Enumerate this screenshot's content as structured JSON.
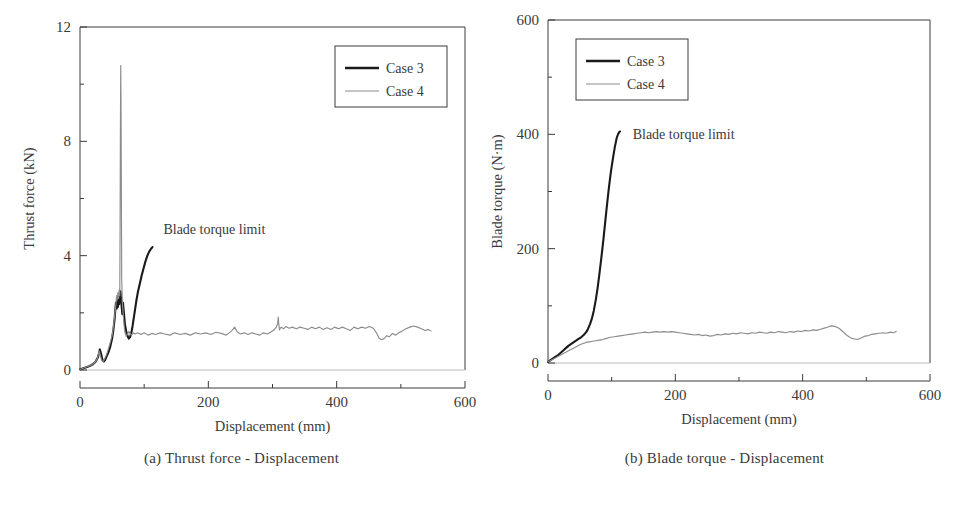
{
  "figure": {
    "background": "#ffffff",
    "ink": "#3a3a3a",
    "panels": [
      {
        "id": "a",
        "caption": "(a) Thrust force - Displacement",
        "annotation": "Blade torque limit"
      },
      {
        "id": "b",
        "caption": "(b) Blade torque - Displacement",
        "annotation": "Blade torque limit"
      }
    ]
  },
  "legend": {
    "entries": [
      {
        "label": "Case 3",
        "color": "#1a1a1a",
        "width": 2.6
      },
      {
        "label": "Case 4",
        "color": "#8c8c8c",
        "width": 1.2
      }
    ]
  },
  "chart_data": [
    {
      "type": "line",
      "title": "(a) Thrust force - Displacement",
      "xlabel": "Displacement (mm)",
      "ylabel": "Thrust force (kN)",
      "xlim": [
        0,
        600
      ],
      "ylim": [
        0,
        12
      ],
      "xticks": [
        0,
        200,
        400,
        600
      ],
      "xticklabels": [
        "0",
        "200",
        "400",
        "600"
      ],
      "xminorticks": [
        100,
        300,
        500
      ],
      "yticks": [
        0,
        4,
        8,
        12
      ],
      "yticklabels": [
        "0",
        "4",
        "8",
        "12"
      ],
      "yminorticks": [
        2,
        6,
        10
      ],
      "grid": false,
      "legend_position": "upper-right",
      "annotations": [
        {
          "text": "Blade torque limit",
          "x": 130,
          "y": 4.75
        }
      ],
      "series": [
        {
          "name": "Case 3",
          "color": "#1a1a1a",
          "x": [
            0,
            5,
            10,
            15,
            20,
            24,
            28,
            31,
            33,
            35,
            37,
            39,
            41,
            44,
            47,
            50,
            52,
            54,
            55,
            56,
            57,
            58,
            59,
            60,
            61,
            62,
            63,
            64,
            65,
            66,
            67,
            68,
            69,
            70,
            72,
            74,
            76,
            78,
            80,
            82,
            84,
            86,
            88,
            90,
            93,
            96,
            99,
            102,
            105,
            108,
            111,
            113
          ],
          "y": [
            0.02,
            0.06,
            0.1,
            0.14,
            0.2,
            0.28,
            0.45,
            0.72,
            0.55,
            0.35,
            0.3,
            0.35,
            0.45,
            0.6,
            0.8,
            1.1,
            1.4,
            1.8,
            2.1,
            2.35,
            2.15,
            2.45,
            2.2,
            2.55,
            2.3,
            2.6,
            2.75,
            2.5,
            2.2,
            1.95,
            2.35,
            2.1,
            1.85,
            1.6,
            1.35,
            1.2,
            1.1,
            1.15,
            1.3,
            1.55,
            1.85,
            2.15,
            2.45,
            2.7,
            3.0,
            3.3,
            3.55,
            3.8,
            4.0,
            4.15,
            4.25,
            4.3
          ]
        },
        {
          "name": "Case 4",
          "color": "#8c8c8c",
          "x": [
            0,
            6,
            12,
            18,
            23,
            27,
            30,
            32,
            34,
            36,
            38,
            41,
            44,
            47,
            50,
            52,
            54,
            56,
            57,
            58,
            59,
            60,
            61,
            62,
            62.5,
            63,
            63.5,
            64,
            64.5,
            65,
            66,
            67,
            68,
            69,
            70,
            72,
            74,
            76,
            78,
            80,
            83,
            86,
            90,
            95,
            100,
            106,
            112,
            118,
            125,
            132,
            140,
            148,
            156,
            164,
            172,
            180,
            188,
            196,
            204,
            212,
            220,
            228,
            236,
            241,
            245,
            250,
            256,
            262,
            268,
            274,
            280,
            286,
            292,
            298,
            303,
            306,
            308,
            309,
            310,
            311,
            312,
            314,
            317,
            321,
            326,
            331,
            337,
            343,
            349,
            355,
            361,
            367,
            373,
            379,
            385,
            391,
            397,
            403,
            409,
            415,
            421,
            427,
            433,
            439,
            445,
            451,
            457,
            462,
            466,
            470,
            474,
            478,
            482,
            487,
            492,
            497,
            502,
            508,
            514,
            520,
            526,
            532,
            538,
            543,
            547
          ],
          "y": [
            0.02,
            0.07,
            0.12,
            0.18,
            0.26,
            0.4,
            0.66,
            0.48,
            0.32,
            0.3,
            0.38,
            0.52,
            0.72,
            0.95,
            1.2,
            1.5,
            1.9,
            2.3,
            2.6,
            2.45,
            2.7,
            2.5,
            2.8,
            2.6,
            5.2,
            8.5,
            10.65,
            9.0,
            6.0,
            3.2,
            2.4,
            2.05,
            1.75,
            1.5,
            1.32,
            1.18,
            1.25,
            1.35,
            1.28,
            1.22,
            1.3,
            1.26,
            1.3,
            1.24,
            1.3,
            1.22,
            1.28,
            1.24,
            1.3,
            1.26,
            1.22,
            1.3,
            1.24,
            1.28,
            1.22,
            1.3,
            1.26,
            1.3,
            1.24,
            1.32,
            1.28,
            1.22,
            1.36,
            1.5,
            1.34,
            1.26,
            1.3,
            1.24,
            1.3,
            1.26,
            1.22,
            1.3,
            1.26,
            1.34,
            1.42,
            1.5,
            1.62,
            1.85,
            1.55,
            1.4,
            1.46,
            1.5,
            1.44,
            1.52,
            1.46,
            1.5,
            1.44,
            1.5,
            1.46,
            1.42,
            1.5,
            1.44,
            1.5,
            1.42,
            1.48,
            1.42,
            1.5,
            1.44,
            1.5,
            1.44,
            1.38,
            1.5,
            1.44,
            1.5,
            1.46,
            1.52,
            1.46,
            1.3,
            1.12,
            1.06,
            1.1,
            1.2,
            1.16,
            1.28,
            1.22,
            1.3,
            1.36,
            1.44,
            1.5,
            1.54,
            1.5,
            1.44,
            1.38,
            1.42,
            1.36
          ]
        }
      ]
    },
    {
      "type": "line",
      "title": "(b) Blade torque - Displacement",
      "xlabel": "Displacement (mm)",
      "ylabel": "Blade torque (N·m)",
      "xlim": [
        0,
        600
      ],
      "ylim": [
        0,
        600
      ],
      "xticks": [
        0,
        200,
        400,
        600
      ],
      "xticklabels": [
        "0",
        "200",
        "400",
        "600"
      ],
      "xminorticks": [
        100,
        300,
        500
      ],
      "yticks": [
        0,
        200,
        400,
        600
      ],
      "yticklabels": [
        "0",
        "200",
        "400",
        "600"
      ],
      "yminorticks": [
        100,
        300,
        500
      ],
      "grid": false,
      "legend_position": "upper-left",
      "annotations": [
        {
          "text": "Blade torque limit",
          "x": 133,
          "y": 392
        }
      ],
      "series": [
        {
          "name": "Case 3",
          "color": "#1a1a1a",
          "x": [
            0,
            4,
            8,
            12,
            16,
            20,
            24,
            28,
            32,
            36,
            40,
            44,
            48,
            52,
            56,
            60,
            63,
            66,
            69,
            72,
            75,
            78,
            81,
            84,
            87,
            90,
            93,
            96,
            99,
            102,
            105,
            108,
            110,
            112,
            113
          ],
          "y": [
            2,
            5,
            8,
            11,
            14,
            18,
            22,
            26,
            30,
            33,
            36,
            39,
            42,
            45,
            49,
            54,
            60,
            68,
            78,
            92,
            110,
            132,
            158,
            186,
            216,
            248,
            280,
            310,
            336,
            358,
            378,
            394,
            400,
            404,
            405
          ]
        },
        {
          "name": "Case 4",
          "color": "#8c8c8c",
          "x": [
            0,
            5,
            10,
            15,
            20,
            25,
            30,
            35,
            40,
            45,
            50,
            55,
            60,
            65,
            70,
            75,
            80,
            86,
            92,
            98,
            104,
            110,
            116,
            122,
            128,
            134,
            140,
            146,
            152,
            158,
            164,
            170,
            176,
            182,
            188,
            194,
            200,
            206,
            212,
            218,
            224,
            230,
            236,
            242,
            248,
            254,
            260,
            266,
            272,
            278,
            284,
            290,
            296,
            302,
            308,
            314,
            320,
            326,
            332,
            338,
            344,
            350,
            356,
            362,
            368,
            374,
            380,
            386,
            392,
            398,
            404,
            410,
            416,
            422,
            428,
            434,
            440,
            445,
            450,
            455,
            458,
            462,
            466,
            470,
            474,
            478,
            482,
            486,
            490,
            494,
            498,
            503,
            508,
            514,
            520,
            526,
            532,
            538,
            543,
            547
          ],
          "y": [
            2,
            5,
            8,
            11,
            14,
            17,
            20,
            23,
            26,
            29,
            32,
            34,
            36,
            37,
            38,
            39,
            40,
            41,
            43,
            45,
            46,
            47,
            48,
            49,
            50,
            51,
            52,
            53,
            54,
            53,
            54,
            55,
            54,
            55,
            54,
            55,
            54,
            53,
            52,
            51,
            50,
            49,
            50,
            48,
            49,
            47,
            48,
            50,
            49,
            51,
            50,
            52,
            51,
            53,
            52,
            51,
            53,
            52,
            54,
            53,
            52,
            54,
            53,
            55,
            54,
            53,
            55,
            54,
            56,
            55,
            57,
            56,
            58,
            57,
            59,
            61,
            63,
            65,
            64,
            62,
            60,
            56,
            52,
            48,
            45,
            43,
            42,
            41,
            43,
            45,
            47,
            48,
            50,
            51,
            52,
            53,
            52,
            54,
            53,
            55
          ]
        }
      ]
    }
  ]
}
